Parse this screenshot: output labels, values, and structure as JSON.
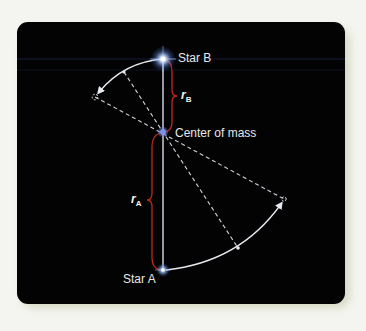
{
  "diagram": {
    "labels": {
      "star_b": "Star B",
      "star_a": "Star A",
      "center_of_mass": "Center of mass",
      "r_b_main": "r",
      "r_b_sub": "B",
      "r_a_main": "r",
      "r_a_sub": "A"
    },
    "colors": {
      "background": "#030303",
      "line": "#d8dde6",
      "bracket": "#c0281c",
      "star_glow": "#9fc4ff",
      "center_dot": "#6f7fd8",
      "frame": "#f4f5f1"
    },
    "points": {
      "star_b": [
        163,
        59
      ],
      "center_of_mass": [
        163,
        132
      ],
      "star_a": [
        163,
        270
      ],
      "ghost_b": [
        95,
        97
      ],
      "ghost_a": [
        284,
        199
      ],
      "marker_b": [
        124,
        72
      ],
      "marker_a": [
        238,
        248
      ]
    }
  }
}
